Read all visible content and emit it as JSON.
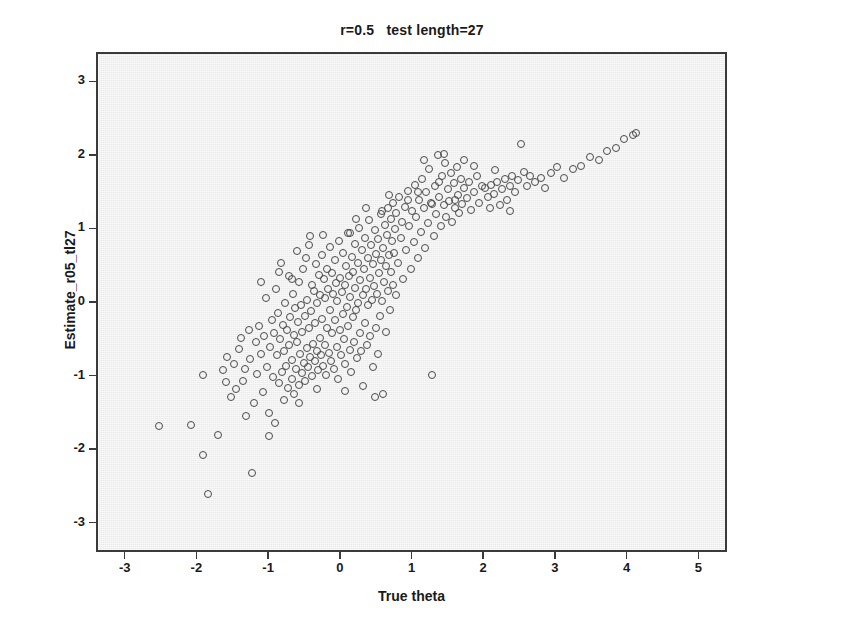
{
  "chart_data": {
    "type": "scatter",
    "title": "r=0.5   test length=27",
    "xlabel": "True theta",
    "ylabel": "Estimate_r05_tl27",
    "xlim": [
      -3.4,
      5.4
    ],
    "ylim": [
      -3.4,
      3.4
    ],
    "xticks": [
      -3,
      -2,
      -1,
      0,
      1,
      2,
      3,
      4,
      5
    ],
    "xtick_labels": [
      "-3",
      "-2",
      "-1",
      "0",
      "1",
      "2",
      "3",
      "4",
      "5"
    ],
    "yticks": [
      3,
      2,
      1,
      0,
      -1,
      -2,
      -3
    ],
    "ytick_labels": [
      "3",
      "2",
      "1",
      "0",
      "-1",
      "-2",
      "-3"
    ],
    "grid": false,
    "legend": "none",
    "marker": "open-circle",
    "marker_color": "#4a4a4a",
    "plot_background": "#eeeeee",
    "frame_color": "#3a3a3a",
    "n_points": 300,
    "points": [
      [
        -2.55,
        -1.66
      ],
      [
        -1.93,
        -2.05
      ],
      [
        -1.86,
        -2.58
      ],
      [
        -1.72,
        -1.78
      ],
      [
        -1.66,
        -0.9
      ],
      [
        -1.6,
        -0.72
      ],
      [
        -1.55,
        -1.27
      ],
      [
        -1.5,
        -0.82
      ],
      [
        -1.47,
        -1.15
      ],
      [
        -1.44,
        -0.61
      ],
      [
        -1.4,
        -0.46
      ],
      [
        -1.38,
        -1.05
      ],
      [
        -1.35,
        -0.88
      ],
      [
        -1.33,
        -1.52
      ],
      [
        -1.3,
        -0.35
      ],
      [
        -1.28,
        -0.75
      ],
      [
        -1.25,
        -2.3
      ],
      [
        -1.22,
        -1.35
      ],
      [
        -1.2,
        -0.52
      ],
      [
        -1.18,
        -0.95
      ],
      [
        -1.15,
        -0.3
      ],
      [
        -1.13,
        -0.68
      ],
      [
        -1.1,
        -1.2
      ],
      [
        -1.08,
        -0.44
      ],
      [
        -1.06,
        0.08
      ],
      [
        -1.04,
        -0.86
      ],
      [
        -1.02,
        -1.48
      ],
      [
        -1.0,
        -0.58
      ],
      [
        -0.98,
        -0.22
      ],
      [
        -0.96,
        -0.99
      ],
      [
        -0.95,
        -0.4
      ],
      [
        -0.93,
        -1.62
      ],
      [
        -0.92,
        0.21
      ],
      [
        -0.9,
        -0.7
      ],
      [
        -0.89,
        -0.12
      ],
      [
        -0.88,
        -1.08
      ],
      [
        -0.86,
        -0.48
      ],
      [
        -0.85,
        0.56
      ],
      [
        -0.84,
        -0.92
      ],
      [
        -0.82,
        -0.28
      ],
      [
        -0.81,
        -1.3
      ],
      [
        -0.8,
        -0.64
      ],
      [
        -0.79,
        0.02
      ],
      [
        -0.78,
        -0.84
      ],
      [
        -0.77,
        -0.36
      ],
      [
        -0.75,
        -1.14
      ],
      [
        -0.74,
        0.38
      ],
      [
        -0.73,
        -0.56
      ],
      [
        -0.72,
        -0.18
      ],
      [
        -0.7,
        -1.02
      ],
      [
        -0.69,
        -0.76
      ],
      [
        -0.68,
        0.14
      ],
      [
        -0.67,
        -0.42
      ],
      [
        -0.66,
        -1.22
      ],
      [
        -0.65,
        -0.06
      ],
      [
        -0.64,
        -0.88
      ],
      [
        -0.63,
        0.72
      ],
      [
        -0.62,
        -0.52
      ],
      [
        -0.61,
        -0.24
      ],
      [
        -0.6,
        -1.1
      ],
      [
        -0.59,
        0.3
      ],
      [
        -0.58,
        -0.68
      ],
      [
        -0.57,
        -0.02
      ],
      [
        -0.56,
        -0.94
      ],
      [
        -0.55,
        -0.38
      ],
      [
        -0.54,
        0.48
      ],
      [
        -0.53,
        -0.8
      ],
      [
        -0.52,
        -0.16
      ],
      [
        -0.51,
        -1.05
      ],
      [
        -0.5,
        0.62
      ],
      [
        -0.49,
        -0.6
      ],
      [
        -0.48,
        0.06
      ],
      [
        -0.47,
        -0.86
      ],
      [
        -0.46,
        -0.32
      ],
      [
        -0.45,
        0.92
      ],
      [
        -0.44,
        -0.72
      ],
      [
        -0.43,
        -0.1
      ],
      [
        -0.42,
        -0.98
      ],
      [
        -0.41,
        0.26
      ],
      [
        -0.4,
        -0.54
      ],
      [
        -0.39,
        0.18
      ],
      [
        -0.38,
        -0.78
      ],
      [
        -0.37,
        -0.26
      ],
      [
        -0.36,
        0.54
      ],
      [
        -0.35,
        -0.64
      ],
      [
        -0.34,
        0.02
      ],
      [
        -0.33,
        -0.9
      ],
      [
        -0.32,
        0.4
      ],
      [
        -0.31,
        -0.46
      ],
      [
        -0.3,
        0.12
      ],
      [
        -0.29,
        -0.7
      ],
      [
        -0.28,
        0.66
      ],
      [
        -0.27,
        -0.2
      ],
      [
        -0.26,
        -0.84
      ],
      [
        -0.25,
        0.34
      ],
      [
        -0.24,
        -0.56
      ],
      [
        -0.23,
        0.08
      ],
      [
        -0.22,
        -0.96
      ],
      [
        -0.21,
        0.48
      ],
      [
        -0.2,
        -0.32
      ],
      [
        -0.19,
        0.2
      ],
      [
        -0.18,
        -0.66
      ],
      [
        -0.17,
        0.78
      ],
      [
        -0.16,
        -0.08
      ],
      [
        -0.15,
        -0.78
      ],
      [
        -0.14,
        0.42
      ],
      [
        -0.13,
        -0.4
      ],
      [
        -0.12,
        0.14
      ],
      [
        -0.11,
        -0.88
      ],
      [
        -0.1,
        0.6
      ],
      [
        -0.09,
        -0.22
      ],
      [
        -0.08,
        0.28
      ],
      [
        -0.07,
        -0.58
      ],
      [
        -0.06,
        0.04
      ],
      [
        -0.05,
        -1.02
      ],
      [
        -0.04,
        0.86
      ],
      [
        -0.03,
        -0.36
      ],
      [
        -0.02,
        0.36
      ],
      [
        -0.01,
        -0.7
      ],
      [
        0.0,
        0.16
      ],
      [
        0.01,
        -0.14
      ],
      [
        0.02,
        0.7
      ],
      [
        0.03,
        -0.48
      ],
      [
        0.04,
        0.26
      ],
      [
        0.05,
        -0.82
      ],
      [
        0.06,
        0.52
      ],
      [
        0.07,
        -0.04
      ],
      [
        0.08,
        0.96
      ],
      [
        0.09,
        -0.3
      ],
      [
        0.1,
        0.38
      ],
      [
        0.11,
        -0.62
      ],
      [
        0.12,
        0.1
      ],
      [
        0.13,
        -0.92
      ],
      [
        0.14,
        0.64
      ],
      [
        0.15,
        -0.18
      ],
      [
        0.16,
        0.44
      ],
      [
        0.17,
        -0.52
      ],
      [
        0.18,
        0.22
      ],
      [
        0.19,
        0.82
      ],
      [
        0.2,
        -0.08
      ],
      [
        0.21,
        -0.74
      ],
      [
        0.22,
        0.56
      ],
      [
        0.23,
        0.02
      ],
      [
        0.24,
        1.04
      ],
      [
        0.25,
        -0.4
      ],
      [
        0.26,
        0.32
      ],
      [
        0.27,
        -0.64
      ],
      [
        0.28,
        0.74
      ],
      [
        0.29,
        0.12
      ],
      [
        0.3,
        -1.12
      ],
      [
        0.31,
        0.48
      ],
      [
        0.32,
        -0.26
      ],
      [
        0.33,
        0.9
      ],
      [
        0.34,
        0.2
      ],
      [
        0.35,
        -0.56
      ],
      [
        0.36,
        0.62
      ],
      [
        0.37,
        -0.02
      ],
      [
        0.38,
        1.14
      ],
      [
        0.39,
        0.36
      ],
      [
        0.4,
        -0.44
      ],
      [
        0.41,
        0.8
      ],
      [
        0.42,
        0.06
      ],
      [
        0.43,
        -0.86
      ],
      [
        0.44,
        0.54
      ],
      [
        0.45,
        0.24
      ],
      [
        0.46,
        1.0
      ],
      [
        0.47,
        -0.32
      ],
      [
        0.48,
        0.68
      ],
      [
        0.49,
        0.14
      ],
      [
        0.5,
        -0.68
      ],
      [
        0.51,
        0.88
      ],
      [
        0.52,
        0.42
      ],
      [
        0.53,
        -0.16
      ],
      [
        0.54,
        1.22
      ],
      [
        0.55,
        0.6
      ],
      [
        0.56,
        0.04
      ],
      [
        0.57,
        -1.22
      ],
      [
        0.58,
        0.76
      ],
      [
        0.59,
        0.3
      ],
      [
        0.6,
        1.08
      ],
      [
        0.61,
        -0.38
      ],
      [
        0.62,
        0.52
      ],
      [
        0.63,
        0.94
      ],
      [
        0.64,
        0.18
      ],
      [
        0.65,
        1.3
      ],
      [
        0.66,
        0.66
      ],
      [
        0.67,
        -0.08
      ],
      [
        0.68,
        1.16
      ],
      [
        0.69,
        0.44
      ],
      [
        0.7,
        0.86
      ],
      [
        0.71,
        0.26
      ],
      [
        0.72,
        1.38
      ],
      [
        0.73,
        0.7
      ],
      [
        0.74,
        1.02
      ],
      [
        0.75,
        0.12
      ],
      [
        0.76,
        1.24
      ],
      [
        0.78,
        0.56
      ],
      [
        0.8,
        1.46
      ],
      [
        0.82,
        0.9
      ],
      [
        0.84,
        1.12
      ],
      [
        0.86,
        0.34
      ],
      [
        0.88,
        1.32
      ],
      [
        0.9,
        0.74
      ],
      [
        0.92,
        1.54
      ],
      [
        0.94,
        1.06
      ],
      [
        0.96,
        0.48
      ],
      [
        0.98,
        1.26
      ],
      [
        1.0,
        0.84
      ],
      [
        1.02,
        1.62
      ],
      [
        1.04,
        1.18
      ],
      [
        1.06,
        0.62
      ],
      [
        1.08,
        1.42
      ],
      [
        1.1,
        0.98
      ],
      [
        1.12,
        1.7
      ],
      [
        1.14,
        1.3
      ],
      [
        1.16,
        0.76
      ],
      [
        1.18,
        1.52
      ],
      [
        1.2,
        1.1
      ],
      [
        1.22,
        1.84
      ],
      [
        1.24,
        1.38
      ],
      [
        1.26,
        -0.97
      ],
      [
        1.28,
        0.92
      ],
      [
        1.3,
        1.6
      ],
      [
        1.32,
        1.22
      ],
      [
        1.34,
        2.02
      ],
      [
        1.36,
        1.46
      ],
      [
        1.38,
        1.06
      ],
      [
        1.4,
        1.74
      ],
      [
        1.42,
        1.34
      ],
      [
        1.44,
        1.92
      ],
      [
        1.46,
        1.18
      ],
      [
        1.48,
        1.56
      ],
      [
        1.5,
        1.4
      ],
      [
        1.52,
        1.78
      ],
      [
        1.54,
        1.12
      ],
      [
        1.56,
        1.64
      ],
      [
        1.58,
        1.3
      ],
      [
        1.6,
        1.86
      ],
      [
        1.62,
        1.48
      ],
      [
        1.64,
        1.24
      ],
      [
        1.66,
        1.7
      ],
      [
        1.68,
        1.36
      ],
      [
        1.7,
        1.58
      ],
      [
        1.74,
        1.44
      ],
      [
        1.78,
        1.66
      ],
      [
        1.8,
        1.28
      ],
      [
        1.84,
        1.52
      ],
      [
        1.88,
        1.74
      ],
      [
        1.92,
        1.38
      ],
      [
        1.96,
        1.6
      ],
      [
        2.0,
        1.58
      ],
      [
        2.04,
        1.46
      ],
      [
        2.08,
        1.62
      ],
      [
        2.12,
        1.5
      ],
      [
        2.16,
        1.66
      ],
      [
        2.2,
        1.34
      ],
      [
        2.24,
        1.56
      ],
      [
        2.28,
        1.7
      ],
      [
        2.3,
        1.42
      ],
      [
        2.34,
        1.6
      ],
      [
        2.38,
        1.74
      ],
      [
        2.42,
        1.52
      ],
      [
        2.46,
        1.68
      ],
      [
        2.5,
        2.18
      ],
      [
        2.54,
        1.8
      ],
      [
        2.58,
        1.6
      ],
      [
        2.62,
        1.74
      ],
      [
        2.7,
        1.66
      ],
      [
        2.78,
        1.72
      ],
      [
        2.84,
        1.58
      ],
      [
        2.92,
        1.78
      ],
      [
        3.0,
        1.86
      ],
      [
        3.1,
        1.72
      ],
      [
        3.22,
        1.84
      ],
      [
        3.34,
        1.88
      ],
      [
        3.46,
        2.0
      ],
      [
        3.58,
        1.96
      ],
      [
        3.7,
        2.08
      ],
      [
        3.82,
        2.12
      ],
      [
        3.94,
        2.24
      ],
      [
        4.06,
        2.3
      ],
      [
        4.1,
        2.32
      ],
      [
        -2.1,
        -1.64
      ],
      [
        -1.02,
        -1.8
      ],
      [
        -0.6,
        -1.34
      ],
      [
        -0.34,
        -1.16
      ],
      [
        0.04,
        -1.18
      ],
      [
        0.46,
        -1.26
      ],
      [
        -1.94,
        -0.96
      ],
      [
        -1.62,
        -1.06
      ],
      [
        0.66,
        1.48
      ],
      [
        1.14,
        1.96
      ],
      [
        1.42,
        2.04
      ],
      [
        1.7,
        1.96
      ],
      [
        2.06,
        1.3
      ],
      [
        2.34,
        1.26
      ],
      [
        0.2,
        1.16
      ],
      [
        0.34,
        1.3
      ],
      [
        -0.46,
        0.8
      ],
      [
        -0.88,
        0.44
      ],
      [
        -1.12,
        0.3
      ],
      [
        0.92,
        1.42
      ],
      [
        1.26,
        1.36
      ],
      [
        1.58,
        1.42
      ],
      [
        -0.7,
        0.34
      ],
      [
        -0.26,
        0.94
      ],
      [
        0.12,
        0.96
      ],
      [
        0.56,
        1.26
      ],
      [
        1.06,
        1.52
      ],
      [
        1.36,
        1.66
      ],
      [
        1.84,
        1.88
      ],
      [
        2.14,
        1.82
      ]
    ]
  }
}
